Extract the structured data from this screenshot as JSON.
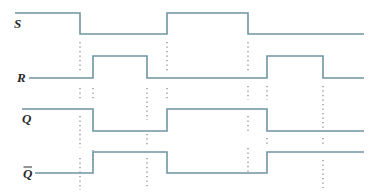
{
  "diagram": {
    "type": "timing-diagram",
    "line_color": "#6f95a2",
    "marker_color": "#8a8a8a",
    "label_color": "#2a2a2a",
    "signals": [
      {
        "name": "S",
        "overline": false,
        "label": "S",
        "label_x": 14,
        "label_y": 28,
        "high_y": 13,
        "low_y": 34,
        "points": [
          [
            15,
            "H"
          ],
          [
            80,
            "H"
          ],
          [
            80,
            "L"
          ],
          [
            167,
            "L"
          ],
          [
            167,
            "H"
          ],
          [
            248,
            "H"
          ],
          [
            248,
            "L"
          ],
          [
            364,
            "L"
          ]
        ]
      },
      {
        "name": "R",
        "overline": false,
        "label": "R",
        "label_x": 17,
        "label_y": 82,
        "high_y": 56,
        "low_y": 78,
        "points": [
          [
            29,
            "L"
          ],
          [
            93,
            "L"
          ],
          [
            93,
            "H"
          ],
          [
            147,
            "H"
          ],
          [
            147,
            "L"
          ],
          [
            267,
            "L"
          ],
          [
            267,
            "H"
          ],
          [
            323,
            "H"
          ],
          [
            323,
            "L"
          ],
          [
            364,
            "L"
          ]
        ]
      },
      {
        "name": "Q",
        "overline": false,
        "label": "Q",
        "label_x": 22,
        "label_y": 123,
        "high_y": 109,
        "low_y": 131,
        "points": [
          [
            22,
            "H"
          ],
          [
            93,
            "H"
          ],
          [
            93,
            "L"
          ],
          [
            167,
            "L"
          ],
          [
            167,
            "H"
          ],
          [
            267,
            "H"
          ],
          [
            267,
            "L"
          ],
          [
            364,
            "L"
          ]
        ]
      },
      {
        "name": "Q-bar",
        "overline": true,
        "label": "Q",
        "label_x": 23,
        "label_y": 178,
        "high_y": 152,
        "low_y": 173,
        "points": [
          [
            35,
            "L"
          ],
          [
            93,
            "L"
          ],
          [
            93,
            "H"
          ],
          [
            167,
            "H"
          ],
          [
            167,
            "L"
          ],
          [
            267,
            "L"
          ],
          [
            267,
            "H"
          ],
          [
            364,
            "H"
          ]
        ]
      }
    ],
    "markers": [
      {
        "x": 80,
        "segments": [
          [
            42,
            72
          ],
          [
            88,
            100
          ],
          [
            116,
            148
          ],
          [
            158,
            190
          ]
        ]
      },
      {
        "x": 93,
        "segments": [
          [
            88,
            100
          ],
          [
            150,
            164
          ]
        ]
      },
      {
        "x": 147,
        "segments": [
          [
            88,
            120
          ],
          [
            134,
            146
          ],
          [
            158,
            188
          ]
        ]
      },
      {
        "x": 167,
        "segments": [
          [
            42,
            72
          ],
          [
            88,
            100
          ]
        ]
      },
      {
        "x": 248,
        "segments": [
          [
            42,
            72
          ],
          [
            86,
            100
          ],
          [
            116,
            132
          ],
          [
            148,
            172
          ]
        ]
      },
      {
        "x": 267,
        "segments": [
          [
            86,
            100
          ],
          [
            138,
            146
          ]
        ]
      },
      {
        "x": 323,
        "segments": [
          [
            86,
            128
          ],
          [
            138,
            146
          ],
          [
            160,
            188
          ]
        ]
      }
    ]
  }
}
